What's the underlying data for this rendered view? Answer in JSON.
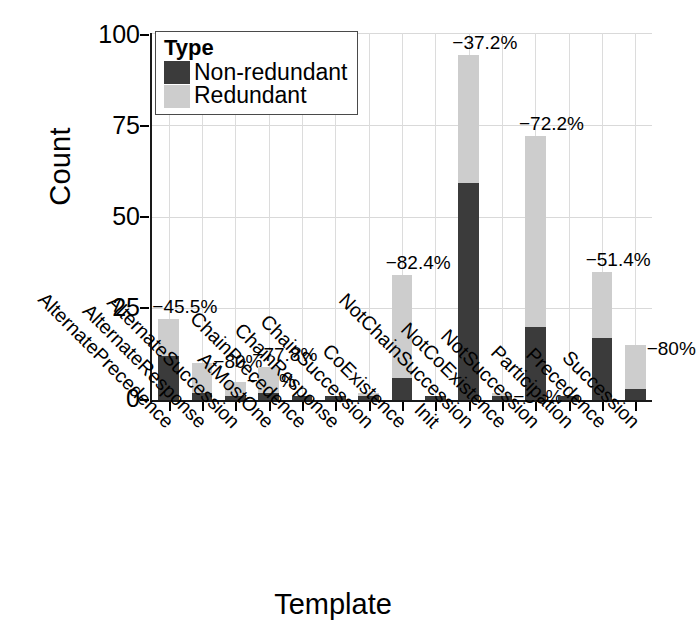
{
  "chart_data": {
    "type": "bar",
    "subtype": "stacked",
    "title": "",
    "xlabel": "Template",
    "ylabel": "Count",
    "ylim": [
      0,
      100
    ],
    "yticks": [
      0,
      25,
      50,
      75,
      100
    ],
    "grid": true,
    "legend": {
      "title": "Type",
      "position": "top-left",
      "entries": [
        {
          "label": "Non-redundant",
          "color": "#3b3b3b"
        },
        {
          "label": "Redundant",
          "color": "#cdcdcd"
        }
      ]
    },
    "categories": [
      "AlternatePrecedence",
      "AlternateResponse",
      "AlternateSuccession",
      "AtMostOne",
      "ChainPrecedence",
      "ChainResponse",
      "ChainSuccession",
      "CoExistence",
      "Init",
      "NotChainSuccession",
      "NotCoExistence",
      "NotSuccession",
      "Participation",
      "Precedence",
      "Succession"
    ],
    "series": [
      {
        "name": "Non-redundant",
        "color": "#3b3b3b",
        "values": [
          12,
          2,
          1,
          2,
          1,
          1,
          1,
          6,
          1,
          59,
          1,
          20,
          1,
          17,
          3
        ]
      },
      {
        "name": "Redundant",
        "color": "#cdcdcd",
        "values": [
          10,
          8,
          4,
          7,
          0,
          0,
          1,
          28,
          0,
          35,
          1,
          52,
          0,
          18,
          12
        ]
      }
    ],
    "totals": [
      22,
      10,
      5,
      9,
      1,
      1,
      2,
      34,
      1,
      94,
      2,
      72,
      1,
      35,
      15
    ],
    "annotations": [
      {
        "category": "AlternatePrecedence",
        "text": "−45.5%"
      },
      {
        "category": "AlternateResponse",
        "text": "−80%"
      },
      {
        "category": "AlternateSuccession",
        "text": "−80%"
      },
      {
        "category": "AtMostOne",
        "text": "−77.8%"
      },
      {
        "category": "CoExistence",
        "text": "−82.4%"
      },
      {
        "category": "NotChainSuccession",
        "text": "−37.2%"
      },
      {
        "category": "NotCoExistence",
        "text": "−50%"
      },
      {
        "category": "NotSuccession",
        "text": "−72.2%"
      },
      {
        "category": "Precedence",
        "text": "−51.4%"
      },
      {
        "category": "Succession",
        "text": "−80%"
      }
    ]
  },
  "axis": {
    "y_title": "Count",
    "x_title": "Template",
    "y_tick_labels": [
      "100",
      "75",
      "50",
      "25",
      "0"
    ]
  }
}
